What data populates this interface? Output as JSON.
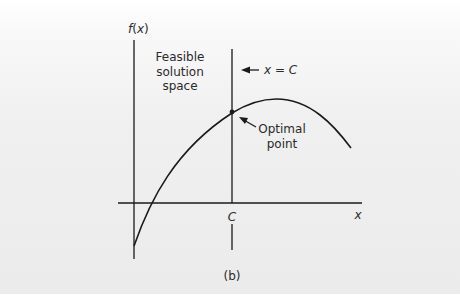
{
  "figure": {
    "caption": "(b)",
    "y_axis_label_f": "f",
    "y_axis_label_open": "(",
    "y_axis_label_x": "x",
    "y_axis_label_close": ")",
    "x_axis_label": "x",
    "c_tick_label": "C",
    "feasible_label": [
      "Feasible",
      "solution",
      "space"
    ],
    "constraint_label": "x = C",
    "optimal_label": [
      "Optimal",
      "point"
    ]
  },
  "colors": {
    "line": "#1a1a1a",
    "text": "#2a2a2a",
    "background": "#ececec"
  }
}
